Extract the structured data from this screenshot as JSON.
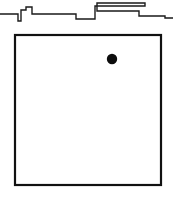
{
  "figure": {
    "canvas": {
      "width": 173,
      "height": 197,
      "background": "#ffffff"
    },
    "skyline": {
      "name": "stepped-skyline-profile",
      "stroke_color": "#1a1a1a",
      "stroke_width": 1.4,
      "description": "Irregular stepped horizontal polyline across the top of the frame",
      "points": "0,14 18,14 18,21 21,21 21,10 26,10 26,7 32,7 32,14 76,14 76,19 95,19 95,6 145,6 145,3 97,3 97,11 139,11 139,16 165,16 165,18 173,18"
    },
    "frame": {
      "name": "outer-square-frame",
      "x": 15,
      "y": 35,
      "width": 146,
      "height": 150,
      "stroke_color": "#111111",
      "stroke_width": 2.2,
      "fill_color": "#ffffff"
    },
    "marker": {
      "name": "filled-dot-marker",
      "cx": 112,
      "cy": 59,
      "r": 5.2,
      "color": "#0d0d0d",
      "label": ""
    }
  },
  "chart_data": {
    "type": "scatter",
    "title": "",
    "xlabel": "",
    "ylabel": "",
    "xlim": [
      15,
      161
    ],
    "ylim": [
      35,
      185
    ],
    "grid": false,
    "legend": null,
    "points": [
      {
        "x": 112,
        "y": 59,
        "label": "",
        "color": "#0d0d0d",
        "size": 10
      }
    ],
    "annotations": [
      {
        "kind": "polyline",
        "name": "stepped-skyline-profile",
        "vertices": [
          [
            0,
            14
          ],
          [
            18,
            14
          ],
          [
            18,
            21
          ],
          [
            21,
            21
          ],
          [
            21,
            10
          ],
          [
            26,
            10
          ],
          [
            26,
            7
          ],
          [
            32,
            7
          ],
          [
            32,
            14
          ],
          [
            76,
            14
          ],
          [
            76,
            19
          ],
          [
            95,
            19
          ],
          [
            95,
            6
          ],
          [
            145,
            6
          ],
          [
            145,
            3
          ],
          [
            97,
            3
          ],
          [
            97,
            11
          ],
          [
            139,
            11
          ],
          [
            139,
            16
          ],
          [
            165,
            16
          ],
          [
            165,
            18
          ],
          [
            173,
            18
          ]
        ]
      },
      {
        "kind": "rectangle",
        "name": "outer-square-frame",
        "x": 15,
        "y": 35,
        "width": 146,
        "height": 150
      }
    ]
  }
}
